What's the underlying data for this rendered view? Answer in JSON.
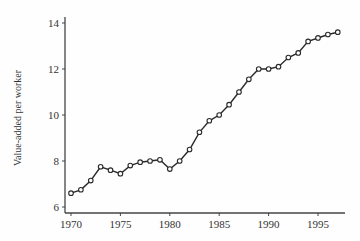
{
  "chart_data": {
    "type": "line",
    "title": "",
    "xlabel": "",
    "ylabel": "Value-added per worker",
    "xlim": [
      1969.5,
      1997.8
    ],
    "ylim": [
      5.8,
      14.4
    ],
    "xticks": [
      1970,
      1975,
      1980,
      1985,
      1990,
      1995
    ],
    "yticks": [
      6,
      8,
      10,
      12,
      14
    ],
    "grid": false,
    "legend": null,
    "marker": "open-circle",
    "series": [
      {
        "name": "Value-added per worker",
        "x": [
          1970,
          1971,
          1972,
          1973,
          1974,
          1975,
          1976,
          1977,
          1978,
          1979,
          1980,
          1981,
          1982,
          1983,
          1984,
          1985,
          1986,
          1987,
          1988,
          1989,
          1990,
          1991,
          1992,
          1993,
          1994,
          1995,
          1996,
          1997
        ],
        "values": [
          6.6,
          6.75,
          7.15,
          7.75,
          7.6,
          7.45,
          7.8,
          7.95,
          8.0,
          8.05,
          7.65,
          8.0,
          8.5,
          9.25,
          9.75,
          10.0,
          10.45,
          11.0,
          11.55,
          12.0,
          12.0,
          12.1,
          12.5,
          12.7,
          13.2,
          13.35,
          13.5,
          13.6
        ]
      }
    ]
  },
  "colors": {
    "line": "#2a2a2a",
    "axis": "#444444",
    "text": "#333333",
    "background": "#fefefe"
  }
}
